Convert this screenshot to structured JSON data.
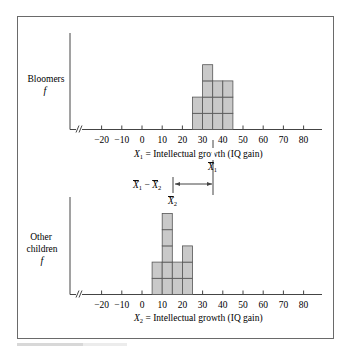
{
  "chart_data": [
    {
      "type": "bar",
      "subtype": "histogram",
      "panel": "top",
      "ylabel": "Bloomers",
      "ylabel_symbol": "f",
      "xlabel": "X₁ = Intellectual growth (IQ gain)",
      "x_ticks": [
        -20,
        -10,
        0,
        10,
        20,
        30,
        40,
        50,
        60,
        70,
        80
      ],
      "axis_break": true,
      "bin_width": 5,
      "bins": [
        {
          "start": 25,
          "end": 30,
          "count": 2
        },
        {
          "start": 30,
          "end": 35,
          "count": 4
        },
        {
          "start": 35,
          "end": 40,
          "count": 3
        },
        {
          "start": 40,
          "end": 45,
          "count": 3
        }
      ],
      "mean_label": "X̄₁",
      "mean_value": 35,
      "grid": false
    },
    {
      "type": "bar",
      "subtype": "histogram",
      "panel": "bottom",
      "ylabel": "Other children",
      "ylabel_symbol": "f",
      "xlabel": "X₂ = Intellectual growth (IQ gain)",
      "x_ticks": [
        -20,
        -10,
        0,
        10,
        20,
        30,
        40,
        50,
        60,
        70,
        80
      ],
      "axis_break": true,
      "bin_width": 5,
      "bins": [
        {
          "start": 5,
          "end": 10,
          "count": 2
        },
        {
          "start": 10,
          "end": 15,
          "count": 5
        },
        {
          "start": 15,
          "end": 20,
          "count": 2
        },
        {
          "start": 20,
          "end": 25,
          "count": 3
        }
      ],
      "mean_label": "X̄₂",
      "mean_value": 15,
      "grid": false
    }
  ],
  "annotation": {
    "difference_label": "X̄₁ − X̄₂",
    "from": 15,
    "to": 35
  },
  "labels": {
    "top_group": "Bloomers",
    "bottom_group_line1": "Other",
    "bottom_group_line2": "children",
    "f": "f",
    "top_xlabel_var": "X",
    "top_xlabel_sub": "1",
    "bottom_xlabel_var": "X",
    "bottom_xlabel_sub": "2",
    "xlabel_rest": " = Intellectual growth (IQ gain)",
    "mean1_var": "X",
    "mean1_sub": "1",
    "mean2_var": "X",
    "mean2_sub": "2",
    "diff_a": "X",
    "diff_a_sub": "1",
    "diff_minus": " − ",
    "diff_b": "X",
    "diff_b_sub": "2"
  },
  "colors": {
    "bar_fill": "#c9c9c9",
    "bar_stroke": "#555555",
    "axis": "#444444",
    "frame": "#6a6a6a"
  }
}
